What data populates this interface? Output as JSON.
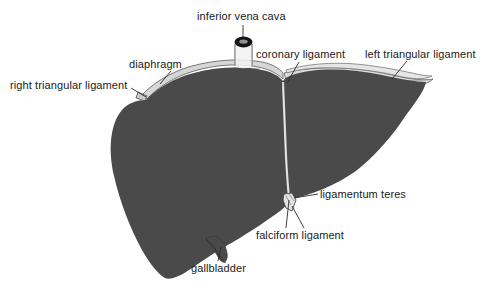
{
  "figure": {
    "width": 487,
    "height": 292,
    "background_color": "#ffffff",
    "liver_fill_color": "#4a4a4a",
    "ligament_fill_color": "#d8d8d8",
    "outline_color": "#555555",
    "leader_line_color": "#2b2b2b",
    "label_text_color": "#1a1a1a"
  },
  "labels": {
    "inferior_vena_cava": "inferior vena cava",
    "diaphragm": "diaphragm",
    "right_triangular_ligament": "right triangular ligament",
    "coronary_ligament": "coronary ligament",
    "left_triangular_ligament": "left triangular ligament",
    "ligamentum_teres": "ligamentum teres",
    "falciform_ligament": "falciform ligament",
    "gallbladder": "gallbladder"
  },
  "structures": [
    {
      "name": "inferior-vena-cava",
      "label": "inferior vena cava",
      "kind": "vessel-stump"
    },
    {
      "name": "diaphragm",
      "label": "diaphragm",
      "kind": "membrane-band"
    },
    {
      "name": "right-triangular-ligament",
      "label": "right triangular ligament",
      "kind": "ligament"
    },
    {
      "name": "coronary-ligament",
      "label": "coronary ligament",
      "kind": "ligament"
    },
    {
      "name": "left-triangular-ligament",
      "label": "left triangular ligament",
      "kind": "ligament"
    },
    {
      "name": "ligamentum-teres",
      "label": "ligamentum teres",
      "kind": "ligament"
    },
    {
      "name": "falciform-ligament",
      "label": "falciform ligament",
      "kind": "ligament"
    },
    {
      "name": "gallbladder",
      "label": "gallbladder",
      "kind": "organ"
    },
    {
      "name": "liver-right-lobe",
      "label": "",
      "kind": "organ-lobe"
    },
    {
      "name": "liver-left-lobe",
      "label": "",
      "kind": "organ-lobe"
    }
  ]
}
